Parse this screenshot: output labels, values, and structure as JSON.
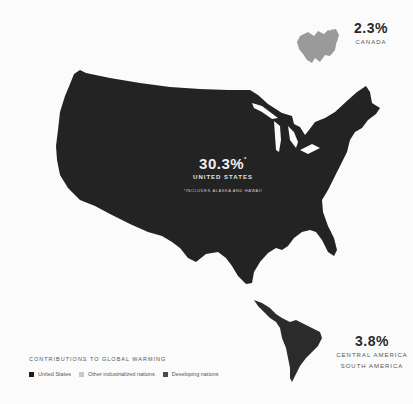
{
  "colors": {
    "background": "#fbfbfb",
    "united_states": "#232323",
    "other_industrialized": "#9a9a9a",
    "developing": "#3a3a3a",
    "legend_text": "#555555"
  },
  "regions": {
    "canada": {
      "percent": "2.3%",
      "name": "CANADA"
    },
    "united_states": {
      "percent": "30.3%",
      "asterisk": "*",
      "name": "UNITED STATES",
      "note": "*INCLUDES ALASKA AND HAWAII"
    },
    "latin_america": {
      "percent": "3.8%",
      "name_line1": "CENTRAL AMERICA",
      "name_line2": "SOUTH AMERICA"
    }
  },
  "legend": {
    "title": "CONTRIBUTIONS TO GLOBAL WARMING",
    "items": [
      {
        "label": "United States",
        "color": "#1e1e1e"
      },
      {
        "label": "Other industrialized nations",
        "color": "#c8c8c8"
      },
      {
        "label": "Developing nations",
        "color": "#4a4a4a"
      }
    ]
  }
}
